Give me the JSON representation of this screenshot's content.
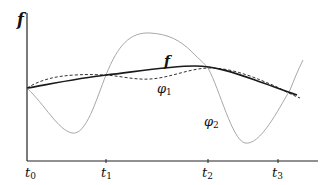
{
  "diagram": {
    "y_axis_label": "f",
    "curve_labels": {
      "f": "f",
      "phi1": {
        "base": "φ",
        "sub": "1"
      },
      "phi2": {
        "base": "φ",
        "sub": "2"
      }
    },
    "ticks": [
      {
        "base": "t",
        "sub": "0"
      },
      {
        "base": "t",
        "sub": "1"
      },
      {
        "base": "t",
        "sub": "2"
      },
      {
        "base": "t",
        "sub": "3"
      }
    ],
    "colors": {
      "axis": "#222222",
      "f": "#1a1a1a",
      "phi1": "#333333",
      "phi2": "#a8a8a8"
    }
  }
}
